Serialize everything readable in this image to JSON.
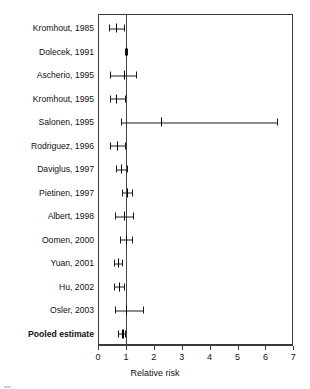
{
  "chart_data": {
    "type": "scatter",
    "subtype": "forest-plot",
    "title": "",
    "xlabel": "Relative risk",
    "ylabel": "",
    "xlim": [
      0,
      7
    ],
    "xticks": [
      0,
      1,
      2,
      3,
      4,
      5,
      6,
      7
    ],
    "xticklabels": [
      "0",
      "1",
      "2",
      "3",
      "4",
      "5",
      "6",
      "7"
    ],
    "grid": false,
    "reference_line": 1,
    "legend": "none",
    "categories": [
      "Kromhout, 1985",
      "Dolecek, 1991",
      "Ascherio, 1995",
      "Kromhout, 1995",
      "Salonen, 1995",
      "Rodriguez, 1996",
      "Daviglus, 1997",
      "Pietinen, 1997",
      "Albert, 1998",
      "Oomen, 2000",
      "Yuan, 2001",
      "Hu, 2002",
      "Osler, 2003",
      "Pooled estimate"
    ],
    "studies": [
      {
        "label": "Kromhout, 1985",
        "rr": 0.64,
        "ci_low": 0.4,
        "ci_high": 0.93,
        "pooled": false
      },
      {
        "label": "Dolecek, 1991",
        "rr": 1.0,
        "ci_low": 0.97,
        "ci_high": 1.03,
        "pooled": false
      },
      {
        "label": "Ascherio, 1995",
        "rr": 0.93,
        "ci_low": 0.43,
        "ci_high": 1.36,
        "pooled": false
      },
      {
        "label": "Kromhout, 1995",
        "rr": 0.66,
        "ci_low": 0.43,
        "ci_high": 0.96,
        "pooled": false
      },
      {
        "label": "Salonen, 1995",
        "rr": 2.25,
        "ci_low": 0.82,
        "ci_high": 6.4,
        "pooled": false
      },
      {
        "label": "Rodriguez, 1996",
        "rr": 0.68,
        "ci_low": 0.44,
        "ci_high": 0.97,
        "pooled": false
      },
      {
        "label": "Daviglus, 1997",
        "rr": 0.83,
        "ci_low": 0.66,
        "ci_high": 1.05,
        "pooled": false
      },
      {
        "label": "Pietinen, 1997",
        "rr": 1.03,
        "ci_low": 0.85,
        "ci_high": 1.22,
        "pooled": false
      },
      {
        "label": "Albert, 1998",
        "rr": 0.92,
        "ci_low": 0.62,
        "ci_high": 1.25,
        "pooled": false
      },
      {
        "label": "Oomen, 2000",
        "rr": 1.0,
        "ci_low": 0.8,
        "ci_high": 1.22,
        "pooled": false
      },
      {
        "label": "Yuan, 2001",
        "rr": 0.72,
        "ci_low": 0.58,
        "ci_high": 0.86,
        "pooled": false
      },
      {
        "label": "Hu, 2002",
        "rr": 0.75,
        "ci_low": 0.58,
        "ci_high": 0.92,
        "pooled": false
      },
      {
        "label": "Osler, 2003",
        "rr": 1.0,
        "ci_low": 0.62,
        "ci_high": 1.6,
        "pooled": false
      },
      {
        "label": "Pooled estimate",
        "rr": 0.87,
        "ci_low": 0.72,
        "ci_high": 0.98,
        "pooled": true
      }
    ]
  },
  "axis": {
    "xlabel": "Relative risk",
    "ticklabels": [
      "0",
      "1",
      "2",
      "3",
      "4",
      "5",
      "6",
      "7"
    ]
  },
  "colors": {
    "line": "#1a1a1a",
    "box": "#3a3a3a",
    "reference": "#444444",
    "text": "#111111",
    "background": "#ffffff"
  }
}
